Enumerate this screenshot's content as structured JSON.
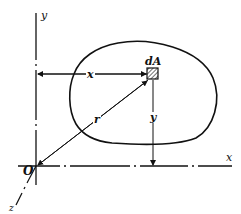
{
  "figure": {
    "labels": {
      "y_axis": "y",
      "x_axis": "x",
      "z_axis": "z",
      "origin": "O",
      "area_element": "dA",
      "x_distance": "x",
      "y_distance": "y",
      "radial_distance": "r"
    },
    "colors": {
      "stroke": "#111111",
      "background": "#ffffff"
    }
  }
}
